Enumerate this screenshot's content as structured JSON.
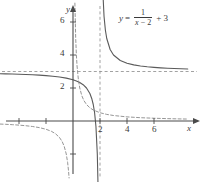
{
  "figure": {
    "name": "rational-function-graph",
    "background": "#ffffff",
    "width": 203,
    "height": 182
  },
  "equation": {
    "lhs": "y",
    "equals": "=",
    "numerator": "1",
    "denominator_var": "x",
    "denominator_minus": " − ",
    "denominator_num": "2",
    "plus": "+ 3",
    "full_text": "y = 1/(x - 2) + 3"
  },
  "axes": {
    "x_label": "x",
    "y_label": "y",
    "x_ticks": [
      {
        "value": -4,
        "label": ""
      },
      {
        "value": -2,
        "label": ""
      },
      {
        "value": 2,
        "label": "2"
      },
      {
        "value": 4,
        "label": "4"
      },
      {
        "value": 6,
        "label": "6"
      }
    ],
    "y_ticks": [
      {
        "value": 2,
        "label": "2"
      },
      {
        "value": 4,
        "label": "4"
      },
      {
        "value": 6,
        "label": "6"
      },
      {
        "value": -2,
        "label": ""
      },
      {
        "value": -4,
        "label": ""
      }
    ],
    "axis_color": "#4a4a4a",
    "origin_px": {
      "x": 73,
      "y": 121
    },
    "scale_px_per_unit": {
      "x": 13.5,
      "y": 16.5
    }
  },
  "chart_data": {
    "type": "line",
    "title": "",
    "xlabel": "x",
    "ylabel": "y",
    "xlim": [
      -5.4,
      8.5
    ],
    "ylim": [
      -3.5,
      7.2
    ],
    "grid": false,
    "legend": "none",
    "annotations": [
      {
        "text": "y = 1/(x - 2) + 3",
        "x": 3.4,
        "y": 6.6
      }
    ],
    "asymptotes": [
      {
        "type": "vertical",
        "value": 2,
        "style": "dashed",
        "color": "#8a8a8a"
      },
      {
        "type": "horizontal",
        "value": 3,
        "style": "dashed",
        "color": "#8a8a8a"
      }
    ],
    "series": [
      {
        "name": "y = 1/(x - 2) + 3",
        "style": "solid",
        "color": "#5a5a5a",
        "branches": [
          {
            "domain": [
              -5.4,
              1.93
            ],
            "points": [
              [
                -5.4,
                2.865
              ],
              [
                -5.0,
                2.857
              ],
              [
                -4.5,
                2.846
              ],
              [
                -4.0,
                2.833
              ],
              [
                -3.5,
                2.818
              ],
              [
                -3.0,
                2.8
              ],
              [
                -2.5,
                2.778
              ],
              [
                -2.0,
                2.75
              ],
              [
                -1.5,
                2.714
              ],
              [
                -1.0,
                2.667
              ],
              [
                -0.5,
                2.6
              ],
              [
                0.0,
                2.5
              ],
              [
                0.25,
                2.429
              ],
              [
                0.5,
                2.333
              ],
              [
                0.75,
                2.2
              ],
              [
                1.0,
                2.0
              ],
              [
                1.25,
                1.667
              ],
              [
                1.4,
                1.333
              ],
              [
                1.5,
                1.0
              ],
              [
                1.6,
                0.5
              ],
              [
                1.7,
                -0.333
              ],
              [
                1.8,
                -2.0
              ],
              [
                1.86,
                -4.143
              ]
            ]
          },
          {
            "domain": [
              2.07,
              8.5
            ],
            "points": [
              [
                2.14,
                10.143
              ],
              [
                2.2,
                8.0
              ],
              [
                2.3,
                6.333
              ],
              [
                2.4,
                5.5
              ],
              [
                2.5,
                5.0
              ],
              [
                2.75,
                4.333
              ],
              [
                3.0,
                4.0
              ],
              [
                3.5,
                3.667
              ],
              [
                4.0,
                3.5
              ],
              [
                4.5,
                3.4
              ],
              [
                5.0,
                3.333
              ],
              [
                5.5,
                3.286
              ],
              [
                6.0,
                3.25
              ],
              [
                6.5,
                3.222
              ],
              [
                7.0,
                3.2
              ],
              [
                7.5,
                3.182
              ],
              [
                8.0,
                3.167
              ],
              [
                8.5,
                3.154
              ]
            ]
          }
        ]
      },
      {
        "name": "y = 1/x",
        "style": "dashed",
        "color": "#8a8a8a",
        "branches": [
          {
            "domain": [
              0.07,
              8.5
            ],
            "points": [
              [
                0.14,
                7.143
              ],
              [
                0.2,
                5.0
              ],
              [
                0.25,
                4.0
              ],
              [
                0.3,
                3.333
              ],
              [
                0.4,
                2.5
              ],
              [
                0.5,
                2.0
              ],
              [
                0.65,
                1.538
              ],
              [
                0.8,
                1.25
              ],
              [
                1.0,
                1.0
              ],
              [
                1.25,
                0.8
              ],
              [
                1.5,
                0.667
              ],
              [
                2.0,
                0.5
              ],
              [
                2.5,
                0.4
              ],
              [
                3.0,
                0.333
              ],
              [
                4.0,
                0.25
              ],
              [
                5.0,
                0.2
              ],
              [
                6.0,
                0.167
              ],
              [
                7.0,
                0.143
              ],
              [
                8.0,
                0.125
              ],
              [
                8.5,
                0.118
              ]
            ]
          },
          {
            "domain": [
              -5.4,
              -0.07
            ],
            "points": [
              [
                -5.4,
                -0.185
              ],
              [
                -5.0,
                -0.2
              ],
              [
                -4.5,
                -0.222
              ],
              [
                -4.0,
                -0.25
              ],
              [
                -3.5,
                -0.286
              ],
              [
                -3.0,
                -0.333
              ],
              [
                -2.5,
                -0.4
              ],
              [
                -2.0,
                -0.5
              ],
              [
                -1.6,
                -0.625
              ],
              [
                -1.3,
                -0.769
              ],
              [
                -1.0,
                -1.0
              ],
              [
                -0.8,
                -1.25
              ],
              [
                -0.65,
                -1.538
              ],
              [
                -0.5,
                -2.0
              ],
              [
                -0.4,
                -2.5
              ],
              [
                -0.33,
                -3.03
              ],
              [
                -0.29,
                -3.45
              ]
            ]
          }
        ]
      }
    ]
  }
}
